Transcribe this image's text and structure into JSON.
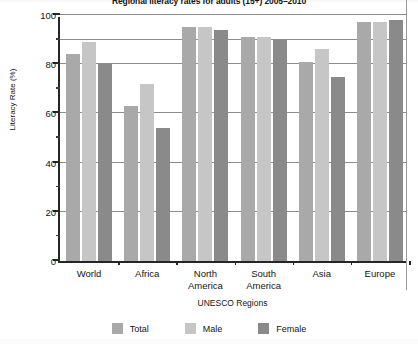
{
  "chart_data": {
    "type": "bar",
    "title": "Regional literacy rates for adults (15+) 2005–2010",
    "xlabel": "UNESCO Regions",
    "ylabel": "Literacy Rate (%)",
    "categories": [
      "World",
      "Africa",
      "North\nAmerica",
      "South\nAmerica",
      "Asia",
      "Europe"
    ],
    "series": [
      {
        "name": "Total",
        "color": "#a9a9a9",
        "values": [
          84,
          63,
          95,
          91,
          81,
          97
        ]
      },
      {
        "name": "Male",
        "color": "#c6c6c6",
        "values": [
          89,
          72,
          95,
          91,
          86,
          97
        ]
      },
      {
        "name": "Female",
        "color": "#8a8a8a",
        "values": [
          80,
          54,
          94,
          90,
          75,
          98
        ]
      }
    ],
    "ylim": [
      0,
      100
    ],
    "ymajor_ticks": [
      0,
      20,
      40,
      60,
      80,
      100
    ],
    "yminor_ticks": [
      10,
      30,
      50,
      70,
      90
    ],
    "gridlines": [
      20,
      40,
      60,
      80,
      90,
      100
    ],
    "grid": true,
    "legend_position": "bottom"
  }
}
